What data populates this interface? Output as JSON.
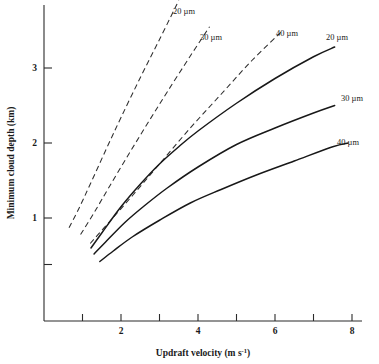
{
  "figure": {
    "background": "#ffffff",
    "ink_color": "#1a1a1a"
  },
  "chart_data": {
    "type": "line",
    "title": "",
    "xlabel": "Updraft velocity (m s⁻¹)",
    "ylabel": "Minimum cloud depth (km)",
    "xlim": [
      0,
      8.3
    ],
    "ylim": [
      0,
      3.6
    ],
    "xticks": [
      1,
      2,
      3,
      4,
      5,
      6,
      7,
      8
    ],
    "xticklabels": [
      "",
      "2",
      "",
      "4",
      "",
      "6",
      "",
      "8"
    ],
    "yticks": [
      0.38,
      1,
      2,
      3
    ],
    "yticklabels": [
      "",
      "1",
      "2",
      "3"
    ],
    "grid": false,
    "legend": "inline-end-labels",
    "series": [
      {
        "name": "20 μm (dashed)",
        "label": "20 µm",
        "style": "dashed",
        "droplet_radius_um": 20,
        "x": [
          0.65,
          0.9,
          1.2,
          1.6,
          2.0,
          2.5,
          3.0,
          3.5
        ],
        "y": [
          0.87,
          1.12,
          1.45,
          1.9,
          2.34,
          2.87,
          3.38,
          3.9
        ]
      },
      {
        "name": "30 μm (dashed)",
        "label": "30 µm",
        "style": "dashed",
        "droplet_radius_um": 30,
        "x": [
          0.95,
          1.3,
          1.7,
          2.2,
          2.7,
          3.2,
          3.8,
          4.3
        ],
        "y": [
          0.78,
          1.07,
          1.42,
          1.85,
          2.27,
          2.68,
          3.16,
          3.55
        ]
      },
      {
        "name": "40 μm (dashed)",
        "label": "40 µm",
        "style": "dashed",
        "droplet_radius_um": 40,
        "x": [
          1.2,
          1.7,
          2.3,
          3.0,
          3.8,
          4.6,
          5.4,
          6.2
        ],
        "y": [
          0.66,
          0.95,
          1.3,
          1.72,
          2.2,
          2.65,
          3.1,
          3.5
        ]
      },
      {
        "name": "20 μm (solid)",
        "label": "20 µm",
        "style": "solid",
        "droplet_radius_um": 20,
        "x": [
          1.22,
          1.5,
          2.0,
          2.5,
          3.0,
          3.5,
          4.0,
          5.0,
          6.0,
          7.0,
          7.55
        ],
        "y": [
          0.6,
          0.8,
          1.15,
          1.45,
          1.72,
          1.95,
          2.16,
          2.53,
          2.86,
          3.15,
          3.28
        ]
      },
      {
        "name": "30 μm (solid)",
        "label": "30 µm",
        "style": "solid",
        "droplet_radius_um": 30,
        "x": [
          1.3,
          1.6,
          2.1,
          2.6,
          3.2,
          4.0,
          5.0,
          6.0,
          7.0,
          7.55
        ],
        "y": [
          0.52,
          0.68,
          0.94,
          1.16,
          1.4,
          1.68,
          1.98,
          2.2,
          2.4,
          2.5
        ]
      },
      {
        "name": "40 μm (solid)",
        "label": "40 µm",
        "style": "solid",
        "droplet_radius_um": 40,
        "x": [
          1.45,
          1.8,
          2.3,
          3.0,
          3.8,
          4.6,
          5.5,
          6.5,
          7.5,
          7.9
        ],
        "y": [
          0.42,
          0.56,
          0.75,
          0.97,
          1.2,
          1.38,
          1.57,
          1.76,
          1.95,
          2.0
        ]
      }
    ],
    "annotations": [
      {
        "text": "20 µm",
        "x_px": 184,
        "y_px": 14,
        "series": "20 μm (dashed)"
      },
      {
        "text": "30 µm",
        "x_px": 211,
        "y_px": 40,
        "series": "30 μm (dashed)"
      },
      {
        "text": "40 µm",
        "x_px": 287,
        "y_px": 36,
        "series": "40 μm (dashed)"
      },
      {
        "text": "20 µm",
        "x_px": 337,
        "y_px": 40,
        "series": "20 μm (solid)"
      },
      {
        "text": "30 µm",
        "x_px": 352,
        "y_px": 101,
        "series": "30 μm (solid)"
      },
      {
        "text": "40 µm",
        "x_px": 348,
        "y_px": 145,
        "series": "40 μm (solid)"
      }
    ]
  }
}
